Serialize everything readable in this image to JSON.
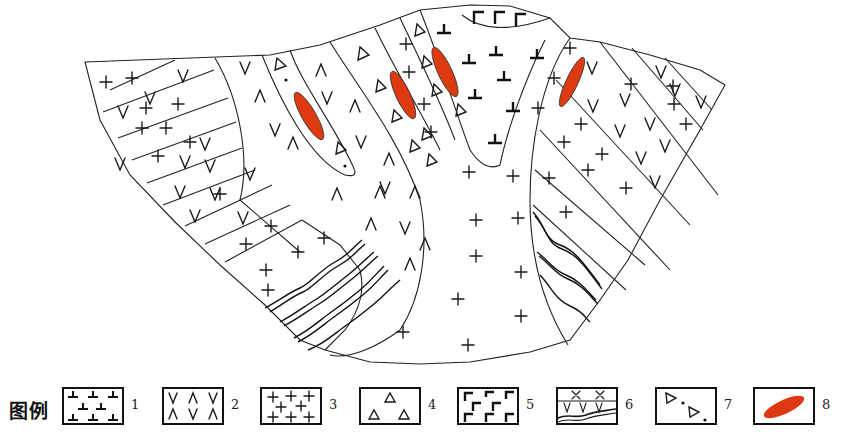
{
  "figure": {
    "type": "geological map / cross-section",
    "ore_color": "#dd3a12",
    "line_color": "#222222",
    "units_in_map": [
      {
        "legend": 3,
        "pattern": "cross"
      },
      {
        "legend": 2,
        "pattern": "v"
      },
      {
        "legend": 4,
        "pattern": "triangle"
      },
      {
        "legend": 7,
        "pattern": "triangle-dot"
      },
      {
        "legend": 1,
        "pattern": "inverted-t"
      },
      {
        "legend": 5,
        "pattern": "step"
      },
      {
        "legend": 6,
        "pattern": "wavy"
      },
      {
        "legend": 8,
        "pattern": "ore-body",
        "count": 4
      }
    ]
  },
  "legend": {
    "title": "图例",
    "items": [
      {
        "number": "1",
        "pattern": "inverted-t-symbols"
      },
      {
        "number": "2",
        "pattern": "v-and-lambda-symbols"
      },
      {
        "number": "3",
        "pattern": "cross-symbols"
      },
      {
        "number": "4",
        "pattern": "triangle-symbols"
      },
      {
        "number": "5",
        "pattern": "step-symbols"
      },
      {
        "number": "6",
        "pattern": "x-over-v-over-wavy-lines"
      },
      {
        "number": "7",
        "pattern": "triangles-with-dots"
      },
      {
        "number": "8",
        "pattern": "red-ellipse-ore-body"
      }
    ]
  }
}
